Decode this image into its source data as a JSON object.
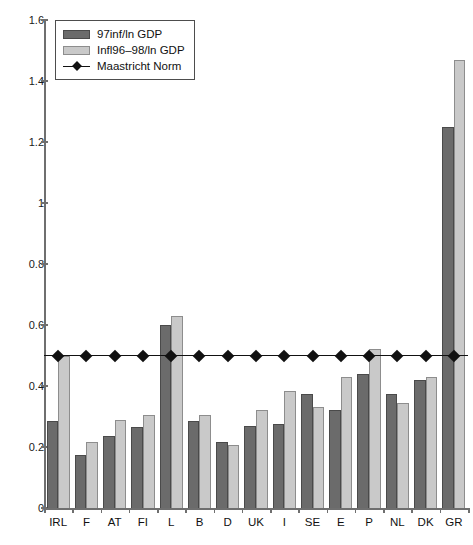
{
  "chart_data": {
    "type": "bar",
    "title": "",
    "xlabel": "",
    "ylabel": "",
    "ylim": [
      0,
      1.6
    ],
    "ytick_values": [
      0,
      0.2,
      0.4,
      0.6,
      0.8,
      1,
      1.2,
      1.4,
      1.6
    ],
    "ytick_labels": [
      "0",
      "0.2",
      "0.4",
      "0.6",
      "0.8",
      "1",
      "1.2",
      "1.4",
      "1.6"
    ],
    "grid": false,
    "legend_position": "top-left",
    "categories": [
      "IRL",
      "F",
      "AT",
      "FI",
      "L",
      "B",
      "D",
      "UK",
      "I",
      "SE",
      "E",
      "P",
      "NL",
      "DK",
      "GR"
    ],
    "series": [
      {
        "name": "97inf/ln GDP",
        "color": "#6b6b6b",
        "values": [
          0.285,
          0.175,
          0.235,
          0.265,
          0.6,
          0.285,
          0.215,
          0.27,
          0.275,
          0.375,
          0.32,
          0.44,
          0.375,
          0.42,
          1.25
        ]
      },
      {
        "name": "Infl96–98/ln GDP",
        "color": "#c9c9c9",
        "values": [
          0.5,
          0.215,
          0.29,
          0.305,
          0.63,
          0.305,
          0.205,
          0.32,
          0.385,
          0.33,
          0.43,
          0.52,
          0.345,
          0.43,
          1.47
        ]
      }
    ],
    "reference_line": {
      "name": "Maastricht Norm",
      "value": 0.5,
      "color": "#111111",
      "marker": "diamond",
      "marker_count": 15
    }
  },
  "legend": {
    "items": [
      {
        "label": "97inf/ln GDP",
        "type": "swatch-dark"
      },
      {
        "label": "Infl96–98/ln GDP",
        "type": "swatch-light"
      },
      {
        "label": "Maastricht Norm",
        "type": "line-diamond"
      }
    ]
  }
}
